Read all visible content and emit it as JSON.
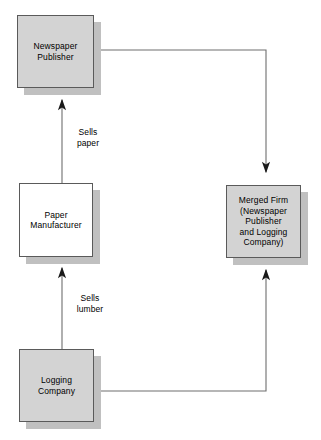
{
  "diagram": {
    "type": "vertical-merger-flow-diagram",
    "background_color": "#ffffff",
    "node_fill_gray": "#d3d3d3",
    "node_fill_white": "#ffffff",
    "node_border_color": "#5a5a5a",
    "shadow_color": "#c0c0c0",
    "connector_color": "#6e6e6e",
    "nodes": [
      {
        "id": "newspaper-publisher",
        "label": "Newspaper\nPublisher",
        "fill": "gray",
        "x": 17,
        "y": 15,
        "w": 77,
        "h": 73
      },
      {
        "id": "paper-manufacturer",
        "label": "Paper\nManufacturer",
        "fill": "white",
        "x": 19,
        "y": 183,
        "w": 74,
        "h": 74
      },
      {
        "id": "logging-company",
        "label": "Logging\nCompany",
        "fill": "gray",
        "x": 19,
        "y": 349,
        "w": 75,
        "h": 73
      },
      {
        "id": "merged-firm",
        "label": "Merged Firm\n(Newspaper\nPublisher\nand Logging\nCompany)",
        "fill": "gray",
        "x": 226,
        "y": 185,
        "w": 75,
        "h": 73
      }
    ],
    "edges": [
      {
        "id": "paper-to-newspaper",
        "from": "paper-manufacturer",
        "to": "newspaper-publisher",
        "label": "Sells\npaper",
        "arrow": "up"
      },
      {
        "id": "logging-to-paper",
        "from": "logging-company",
        "to": "paper-manufacturer",
        "label": "Sells\nlumber",
        "arrow": "up"
      },
      {
        "id": "newspaper-to-merged",
        "from": "newspaper-publisher",
        "to": "merged-firm",
        "label": "",
        "arrow": "down"
      },
      {
        "id": "logging-to-merged",
        "from": "logging-company",
        "to": "merged-firm",
        "label": "",
        "arrow": "up"
      }
    ]
  }
}
